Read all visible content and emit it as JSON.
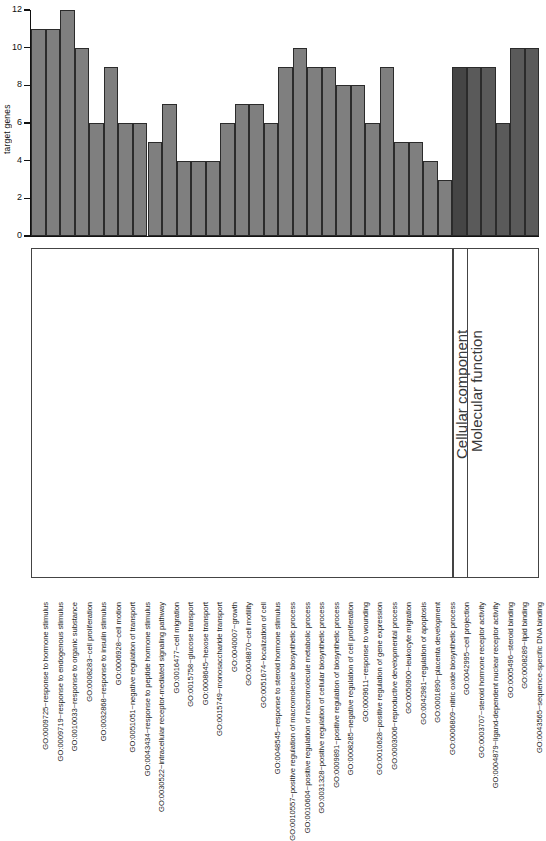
{
  "chart_data": {
    "type": "bar",
    "title": "",
    "xlabel": "",
    "ylabel": "target genes",
    "ylim": [
      0,
      12
    ],
    "yticks": [
      0,
      2,
      4,
      6,
      8,
      10,
      12
    ],
    "grid": false,
    "legend": "none",
    "bar_colors": {
      "biological_process": "#7f7f7f",
      "cellular_component": "#454545",
      "molecular_function": "#5a5a5a"
    },
    "categories": [
      "GO:0009725~response to hormone stimulus",
      "GO:0009719~response to endogenous stimulus",
      "GO:0010033~response to organic substance",
      "GO:0008283~cell proliferation",
      "GO:0032868~response to insulin stimulus",
      "GO:0006928~cell motion",
      "GO:0051051~negative regulation of transport",
      "GO:0043434~response to peptide hormone stimulus",
      "GO:0030522~intracellular receptor-mediated signaling pathway",
      "GO:0016477~cell migration",
      "GO:0015758~glucose transport",
      "GO:0008645~hexose transport",
      "GO:0015749~monosaccharide transport",
      "GO:0040007~growth",
      "GO:0048870~cell motility",
      "GO:0051674~localization of cell",
      "GO:0048545~response to steroid hormone stimulus",
      "GO:0010557~positive regulation of macromolecule biosynthetic process",
      "GO:0010604~positive regulation of macromolecule metabolic process",
      "GO:0031328~positive regulation of cellular biosynthetic process",
      "GO:0009891~positive regulation of biosynthetic process",
      "GO:0008285~negative regulation of cell proliferation",
      "GO:0009611~response to wounding",
      "GO:0010628~positive regulation of gene expression",
      "GO:0003006~reproductive developmental process",
      "GO:0050900~leukocyte migration",
      "GO:0042981~regulation of apoptosis",
      "GO:0001890~placenta development",
      "GO:0006809~nitric oxide biosynthetic process",
      "GO:0042995~cell projection",
      "GO:0003707~steroid hormone receptor activity",
      "GO:0004879~ligand-dependent nuclear receptor activity",
      "GO:0005496~steroid binding",
      "GO:0008289~lipid binding",
      "GO:0043565~sequence-specific DNA binding"
    ],
    "values": [
      11,
      11,
      12,
      10,
      6,
      9,
      6,
      6,
      5,
      7,
      4,
      4,
      4,
      6,
      7,
      7,
      6,
      9,
      10,
      9,
      9,
      8,
      8,
      6,
      9,
      5,
      5,
      4,
      3,
      9,
      9,
      9,
      6,
      10,
      10
    ],
    "groups": [
      {
        "name": "Biological process",
        "label_shown": false,
        "start_index": 0,
        "end_index": 28,
        "color": "#7f7f7f"
      },
      {
        "name": "Cellular component",
        "label_shown": true,
        "start_index": 29,
        "end_index": 29,
        "color": "#454545"
      },
      {
        "name": "Molecular function",
        "label_shown": true,
        "start_index": 30,
        "end_index": 34,
        "color": "#5a5a5a"
      }
    ]
  },
  "axis": {
    "y_title": "target genes",
    "y_tick_labels": [
      "0",
      "2",
      "4",
      "6",
      "8",
      "10",
      "12"
    ]
  },
  "group_labels": {
    "cellular_component": "Cellular component",
    "molecular_function": "Molecular function"
  }
}
